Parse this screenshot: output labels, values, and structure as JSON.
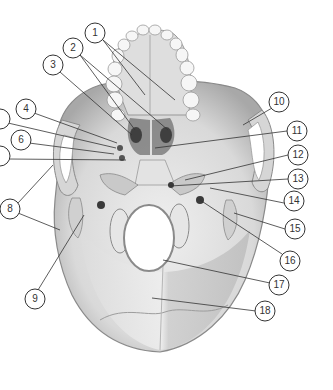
{
  "diagram": {
    "colors": {
      "background": "#ffffff",
      "bone_light": "#ececec",
      "bone_mid": "#cfcfcf",
      "bone_dark": "#9a9a9a",
      "shadow": "#555555",
      "leader_line": "#333333",
      "callout_stroke": "#333333",
      "callout_fill": "#ffffff"
    },
    "callouts": [
      {
        "id": "1",
        "label": "1",
        "cx": 95,
        "cy": 33
      },
      {
        "id": "2",
        "label": "2",
        "cx": 73,
        "cy": 48
      },
      {
        "id": "3",
        "label": "3",
        "cx": 53,
        "cy": 65
      },
      {
        "id": "4",
        "label": "4",
        "cx": 26,
        "cy": 109
      },
      {
        "id": "5",
        "label": "5",
        "cx": 0,
        "cy": 119
      },
      {
        "id": "6",
        "label": "6",
        "cx": 21,
        "cy": 140
      },
      {
        "id": "7",
        "label": "7",
        "cx": 0,
        "cy": 156
      },
      {
        "id": "8",
        "label": "8",
        "cx": 10,
        "cy": 209
      },
      {
        "id": "9",
        "label": "9",
        "cx": 35,
        "cy": 299
      },
      {
        "id": "10",
        "label": "10",
        "cx": 279,
        "cy": 102
      },
      {
        "id": "11",
        "label": "11",
        "cx": 297,
        "cy": 131
      },
      {
        "id": "12",
        "label": "12",
        "cx": 298,
        "cy": 155
      },
      {
        "id": "13",
        "label": "13",
        "cx": 298,
        "cy": 179
      },
      {
        "id": "14",
        "label": "14",
        "cx": 294,
        "cy": 201
      },
      {
        "id": "15",
        "label": "15",
        "cx": 295,
        "cy": 229
      },
      {
        "id": "16",
        "label": "16",
        "cx": 290,
        "cy": 261
      },
      {
        "id": "17",
        "label": "17",
        "cx": 279,
        "cy": 285
      },
      {
        "id": "18",
        "label": "18",
        "cx": 265,
        "cy": 311
      }
    ]
  }
}
